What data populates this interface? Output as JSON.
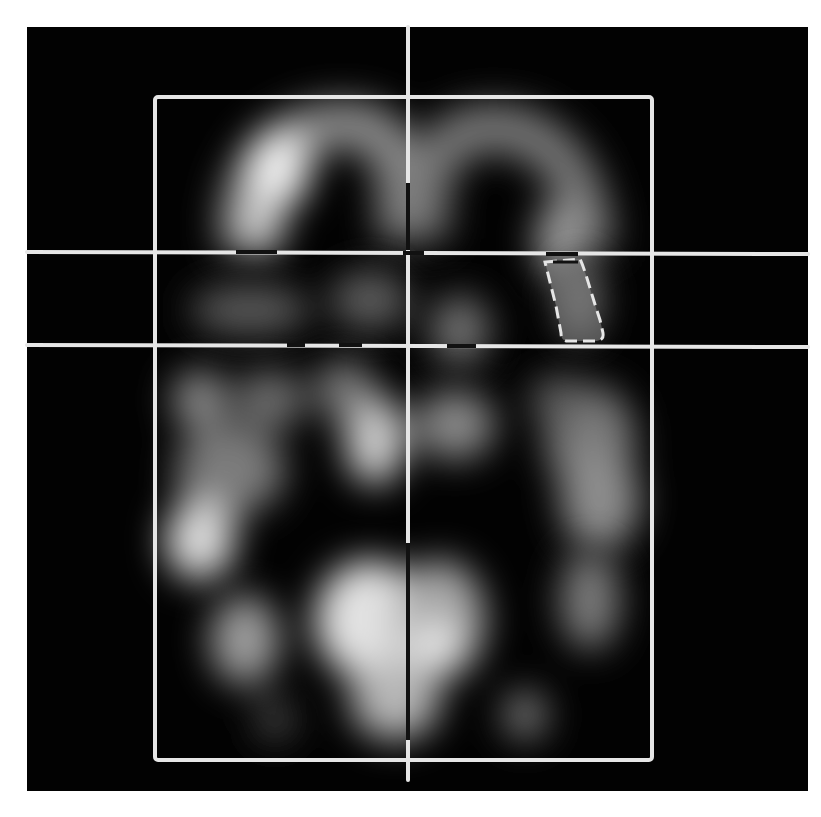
{
  "image": {
    "description": "Axial brain SPECT perfusion slice with overlaid reference grid and region of interest",
    "modality_hint": "grayscale functional brain scan",
    "background_color": "#ffffff",
    "scan_background": "#020202",
    "overlay_color": "#e6e6e6",
    "marker_dark_color": "#111111"
  },
  "overlay": {
    "bounding_box": {
      "x1": 155,
      "y1": 97,
      "x2": 652,
      "y2": 760
    },
    "midline": {
      "x": 408,
      "y_top": 27,
      "y_bottom": 780
    },
    "horizontal_lines": [
      {
        "name": "upper-reference-line",
        "y": 252
      },
      {
        "name": "lower-reference-line",
        "y": 345
      }
    ],
    "roi": {
      "label": "region-of-interest",
      "x": 542,
      "y": 255,
      "w": 63,
      "h": 87
    }
  }
}
